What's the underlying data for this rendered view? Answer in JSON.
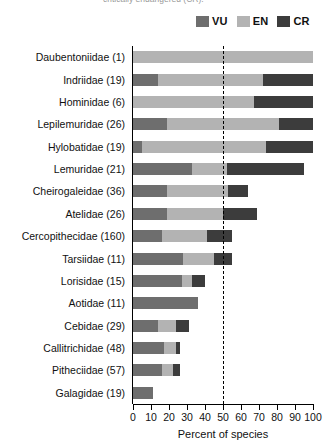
{
  "caption": {
    "text": "critically endangered (CR)."
  },
  "legend": {
    "position": "top-right",
    "items": [
      {
        "label": "VU",
        "color": "#6e6e6e",
        "name": "vulnerable"
      },
      {
        "label": "EN",
        "color": "#b3b3b3",
        "name": "endangered"
      },
      {
        "label": "CR",
        "color": "#3c3c3c",
        "name": "critically-endangered"
      }
    ]
  },
  "axis": {
    "xlabel": "Percent of species",
    "xticks": [
      0,
      10,
      20,
      30,
      40,
      50,
      60,
      70,
      80,
      90,
      100
    ],
    "reference_line": 50
  },
  "chart_data": {
    "type": "bar",
    "orientation": "horizontal",
    "stacked": true,
    "title": "",
    "subtitle": "",
    "xlabel": "Percent of species",
    "ylabel": "",
    "xlim": [
      0,
      100
    ],
    "grid": false,
    "legend_position": "top-right",
    "annotations": [
      {
        "type": "vertical-dashed-line",
        "value": 50
      }
    ],
    "categories": [
      "Daubentoniidae (1)",
      "Indriidae (19)",
      "Hominidae (6)",
      "Lepilemuridae (26)",
      "Hylobatidae (19)",
      "Lemuridae (21)",
      "Cheirogaleidae (36)",
      "Atelidae (26)",
      "Cercopithecidae (160)",
      "Tarsiidae (11)",
      "Lorisidae (15)",
      "Aotidae (11)",
      "Cebidae (29)",
      "Callitrichidae (48)",
      "Pitheciidae (57)",
      "Galagidae (19)"
    ],
    "series": [
      {
        "name": "VU",
        "color": "#6e6e6e",
        "values": [
          0,
          14,
          0,
          19,
          5,
          33,
          19,
          19,
          16,
          28,
          27,
          36,
          14,
          17,
          16,
          11
        ]
      },
      {
        "name": "EN",
        "color": "#b3b3b3",
        "values": [
          100,
          58,
          67,
          62,
          69,
          19,
          34,
          31,
          25,
          17,
          6,
          0,
          10,
          7,
          6,
          0
        ]
      },
      {
        "name": "CR",
        "color": "#3c3c3c",
        "values": [
          0,
          28,
          33,
          19,
          26,
          43,
          11,
          19,
          14,
          10,
          7,
          0,
          7,
          2,
          4,
          0
        ]
      }
    ],
    "totals": [
      100,
      100,
      100,
      100,
      100,
      95,
      64,
      69,
      55,
      55,
      40,
      36,
      31,
      26,
      26,
      11
    ]
  }
}
